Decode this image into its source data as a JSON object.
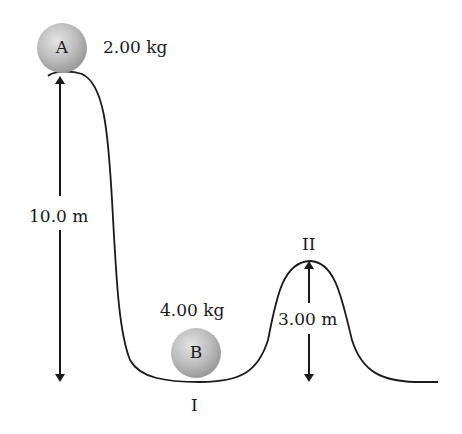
{
  "diagram": {
    "type": "physics-track",
    "ball_a": {
      "label": "A",
      "mass": "2.00 kg"
    },
    "ball_b": {
      "label": "B",
      "mass": "4.00 kg"
    },
    "heights": {
      "left": "10.0 m",
      "hump": "3.00 m"
    },
    "points": {
      "valley": "I",
      "hump": "II"
    },
    "colors": {
      "ball": "#b8b8b8",
      "track": "#1a1a1a"
    }
  }
}
